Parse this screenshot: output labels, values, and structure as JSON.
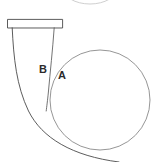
{
  "figure": {
    "background_color": "#ffffff",
    "width": 154,
    "height": 162,
    "stroke_colors": {
      "outline": "#4a4a4a",
      "circle": "#8a8a8a",
      "faint_arc": "#c9c9c9",
      "inner_line": "#5a5a5a"
    }
  },
  "labels": [
    {
      "id": "A",
      "text": "A",
      "x": 58,
      "y": 70
    },
    {
      "id": "B",
      "text": "B",
      "x": 39,
      "y": 64
    }
  ],
  "shapes": {
    "top_bar": {
      "name": "horizontal rectangle bar",
      "x": 7,
      "y": 19,
      "width": 56,
      "height": 9
    },
    "left_limb": {
      "name": "outer tapering limb curving right",
      "top_x": 12,
      "top_y": 28,
      "bottom_x": 118,
      "bottom_y": 162
    },
    "inner_limb": {
      "name": "inner tapering line ending mid-figure",
      "top_x": 54,
      "top_y": 28,
      "end_x": 46,
      "end_y": 111
    },
    "main_circle": {
      "name": "large circle",
      "cx": 100,
      "cy": 100,
      "r": 50
    },
    "clipped_arc": {
      "name": "faint partial ellipse clipped at top edge",
      "cx": 90,
      "cy": -12,
      "rx": 27,
      "ry": 16
    }
  }
}
